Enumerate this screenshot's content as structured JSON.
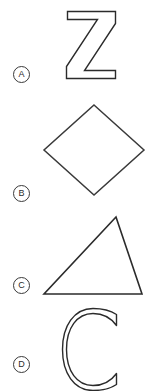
{
  "panel": {
    "name": "multiple-choice-shape-options",
    "background_color": "#ffffff",
    "stroke_color": "#2b2b2b",
    "marker_stroke_color": "#3a3a3a"
  },
  "options": [
    {
      "letter": "A",
      "shape_name": "letter-z-outline",
      "shape_description": "Outlined block capital letter Z"
    },
    {
      "letter": "B",
      "shape_name": "diamond-outline",
      "shape_description": "Outlined diamond (square rotated 45 degrees)"
    },
    {
      "letter": "C",
      "shape_name": "triangle-outline",
      "shape_description": "Outlined scalene triangle with apex right of center"
    },
    {
      "letter": "D",
      "shape_name": "letter-c-outline",
      "shape_description": "Outlined block capital letter C"
    }
  ]
}
